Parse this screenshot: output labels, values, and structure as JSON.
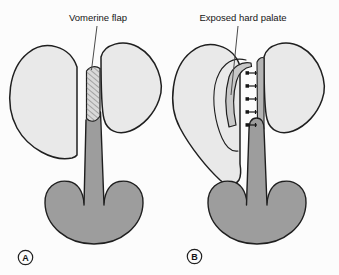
{
  "figure": {
    "panels": [
      {
        "letter": "A",
        "annotation": "Vomerine flap"
      },
      {
        "letter": "B",
        "annotation": "Exposed hard palate"
      }
    ]
  },
  "colors": {
    "background": "#fcfcfc",
    "outline": "#1f1f1f",
    "shelf_fill": "#e9e9e9",
    "hatch_fill": "#d9d9d9",
    "hatch_line": "#6b6b6b",
    "flap_fill": "#c8c8c8",
    "vomer_strip_fill": "#b4b4b4",
    "soft_tissue_fill": "#9d9d9d",
    "suture_color": "#161616",
    "leader_line": "#4a4a4a",
    "label_color": "#151515"
  }
}
